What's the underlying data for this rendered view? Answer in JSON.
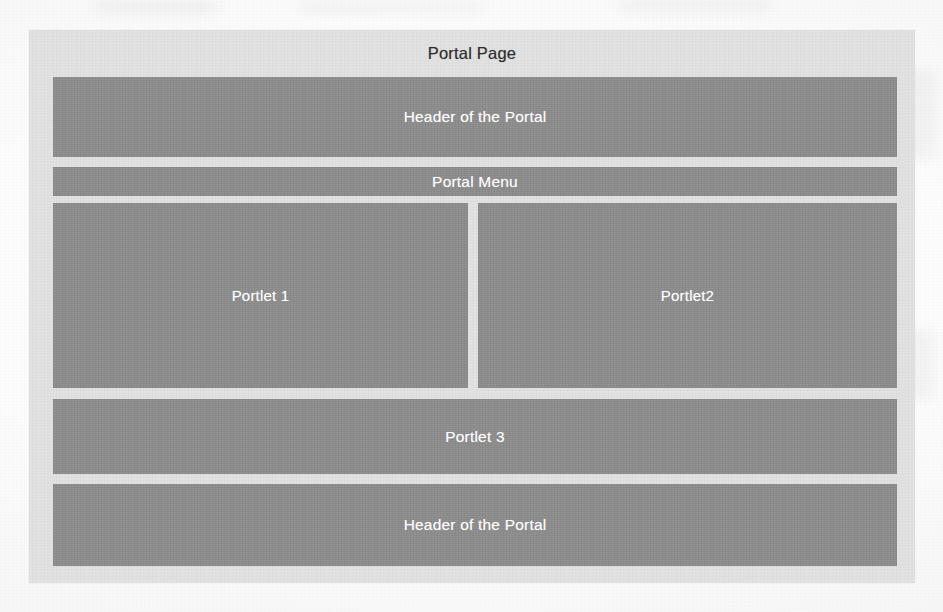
{
  "diagram": {
    "title": "Portal Page",
    "blocks": [
      {
        "id": "header",
        "label": "Header of the Portal"
      },
      {
        "id": "menu",
        "label": "Portal Menu"
      },
      {
        "id": "portlet1",
        "label": "Portlet 1"
      },
      {
        "id": "portlet2",
        "label": "Portlet2"
      },
      {
        "id": "portlet3",
        "label": "Portlet 3"
      },
      {
        "id": "footer",
        "label": "Header of the Portal"
      }
    ],
    "colors": {
      "page_background": "#fdfdfd",
      "container_fill": "#e3e3e3",
      "block_fill": "#8e8e8e",
      "block_text": "#ffffff",
      "title_text": "#2c2c2c"
    }
  }
}
